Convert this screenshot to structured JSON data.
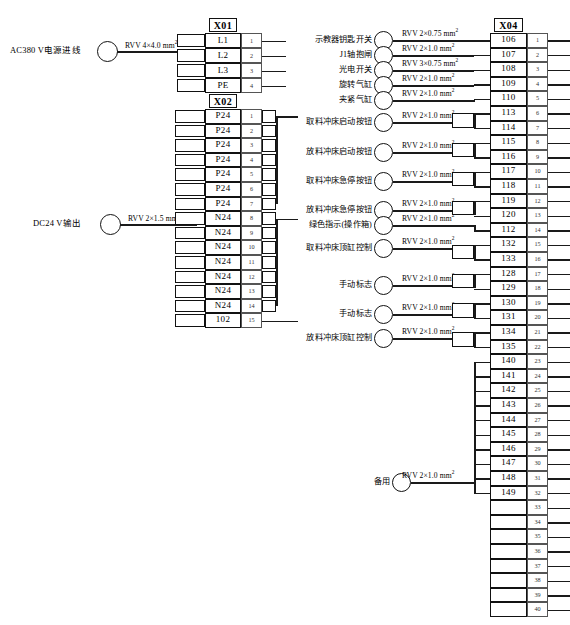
{
  "diagram": {
    "sources": [
      {
        "name": "ac-power-input",
        "label": "AC380 V电源进线",
        "cable": "RVV 4×4.0 mm",
        "sup": "2"
      },
      {
        "name": "dc24-output",
        "label": "DC24 V输出",
        "cable": "RVV 2×1.5 mm",
        "sup": "2"
      }
    ],
    "blocks": [
      {
        "id": "X01",
        "name": "X01",
        "terminals": [
          {
            "tag": "L1",
            "no": "1"
          },
          {
            "tag": "L2",
            "no": "2"
          },
          {
            "tag": "L3",
            "no": "3"
          },
          {
            "tag": "PE",
            "no": "4"
          }
        ]
      },
      {
        "id": "X02",
        "name": "X02",
        "terminals": [
          {
            "tag": "P24",
            "no": "1"
          },
          {
            "tag": "P24",
            "no": "2"
          },
          {
            "tag": "P24",
            "no": "3"
          },
          {
            "tag": "P24",
            "no": "4"
          },
          {
            "tag": "P24",
            "no": "5"
          },
          {
            "tag": "P24",
            "no": "6"
          },
          {
            "tag": "P24",
            "no": "7"
          },
          {
            "tag": "N24",
            "no": "8"
          },
          {
            "tag": "N24",
            "no": "9"
          },
          {
            "tag": "N24",
            "no": "10"
          },
          {
            "tag": "N24",
            "no": "11"
          },
          {
            "tag": "N24",
            "no": "12"
          },
          {
            "tag": "N24",
            "no": "13"
          },
          {
            "tag": "N24",
            "no": "14"
          },
          {
            "tag": "102",
            "no": "15"
          }
        ]
      },
      {
        "id": "X04",
        "name": "X04",
        "terminals": [
          {
            "tag": "106",
            "no": "1"
          },
          {
            "tag": "107",
            "no": "2"
          },
          {
            "tag": "108",
            "no": "3"
          },
          {
            "tag": "109",
            "no": "4"
          },
          {
            "tag": "110",
            "no": "5"
          },
          {
            "tag": "113",
            "no": "6"
          },
          {
            "tag": "114",
            "no": "7"
          },
          {
            "tag": "115",
            "no": "8"
          },
          {
            "tag": "116",
            "no": "9"
          },
          {
            "tag": "117",
            "no": "10"
          },
          {
            "tag": "118",
            "no": "11"
          },
          {
            "tag": "119",
            "no": "12"
          },
          {
            "tag": "120",
            "no": "13"
          },
          {
            "tag": "112",
            "no": "14"
          },
          {
            "tag": "132",
            "no": "15"
          },
          {
            "tag": "133",
            "no": "16"
          },
          {
            "tag": "128",
            "no": "17"
          },
          {
            "tag": "129",
            "no": "18"
          },
          {
            "tag": "130",
            "no": "19"
          },
          {
            "tag": "131",
            "no": "20"
          },
          {
            "tag": "134",
            "no": "21"
          },
          {
            "tag": "135",
            "no": "22"
          },
          {
            "tag": "140",
            "no": "23"
          },
          {
            "tag": "141",
            "no": "24"
          },
          {
            "tag": "142",
            "no": "25"
          },
          {
            "tag": "143",
            "no": "26"
          },
          {
            "tag": "144",
            "no": "27"
          },
          {
            "tag": "145",
            "no": "28"
          },
          {
            "tag": "146",
            "no": "29"
          },
          {
            "tag": "147",
            "no": "30"
          },
          {
            "tag": "148",
            "no": "31"
          },
          {
            "tag": "149",
            "no": "32"
          },
          {
            "tag": "",
            "no": "33"
          },
          {
            "tag": "",
            "no": "34"
          },
          {
            "tag": "",
            "no": "35"
          },
          {
            "tag": "",
            "no": "36"
          },
          {
            "tag": "",
            "no": "37"
          },
          {
            "tag": "",
            "no": "38"
          },
          {
            "tag": "",
            "no": "39"
          },
          {
            "tag": "",
            "no": "40"
          }
        ]
      }
    ],
    "devices": [
      {
        "name": "teach-pendant-key-switch",
        "label": "示教器钥匙开关",
        "cable": "RVV 2×0.75 mm",
        "sup": "2"
      },
      {
        "name": "j1-axis-brake",
        "label": "J1轴抱闸",
        "cable": "RVV 2×1.0 mm",
        "sup": "2"
      },
      {
        "name": "photoelectric-switch",
        "label": "光电开关",
        "cable": "RVV 3×0.75 mm",
        "sup": "2"
      },
      {
        "name": "rotary-cylinder",
        "label": "旋转气缸",
        "cable": "RVV 2×1.0 mm",
        "sup": "2"
      },
      {
        "name": "clamp-cylinder",
        "label": "夹紧气缸",
        "cable": "RVV 2×1.0 mm",
        "sup": "2"
      },
      {
        "name": "pickup-press-start-button",
        "label": "取料冲床启动按钮",
        "cable": "RVV 2×1.0 mm",
        "sup": "2"
      },
      {
        "name": "unload-press-start-button",
        "label": "放料冲床启动按钮",
        "cable": "RVV 2×1.0 mm",
        "sup": "2"
      },
      {
        "name": "pickup-press-estop-button",
        "label": "取料冲床急停按钮",
        "cable": "RVV 2×1.0 mm",
        "sup": "2"
      },
      {
        "name": "unload-press-estop-button",
        "label": "放料冲床急停按钮",
        "cable": "RVV 2×1.0 mm",
        "sup": "2"
      },
      {
        "name": "green-indicator-panel",
        "label": "绿色指示(操作箱)",
        "cable": "RVV 2×1.0 mm",
        "sup": "2"
      },
      {
        "name": "pickup-press-ram-control",
        "label": "取料冲床顶缸控制",
        "cable": "RVV 2×1.0 mm",
        "sup": "2"
      },
      {
        "name": "manual-flag-1",
        "label": "手动标志",
        "cable": "RVV 2×1.0 mm",
        "sup": "2"
      },
      {
        "name": "manual-flag-2",
        "label": "手动标志",
        "cable": "RVV 2×1.0 mm",
        "sup": "2"
      },
      {
        "name": "unload-press-ram-control",
        "label": "放料冲床顶缸控制",
        "cable": "RVV 2×1.0 mm",
        "sup": "2"
      },
      {
        "name": "spare",
        "label": "备用",
        "cable": "RVV 2×1.0 mm",
        "sup": "2"
      }
    ]
  }
}
